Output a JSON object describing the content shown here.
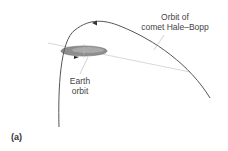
{
  "figure": {
    "panel_label": "(a)",
    "labels": {
      "comet_line1": "Orbit of",
      "comet_line2": "comet Hale–Bopp",
      "earth_line1": "Earth",
      "earth_line2": "orbit"
    },
    "colors": {
      "comet_orbit": "#555555",
      "earth_orbit_fill": "#8a8a8a",
      "plane_line": "#c8c8c8",
      "leader_line": "#bdbdbd"
    }
  }
}
